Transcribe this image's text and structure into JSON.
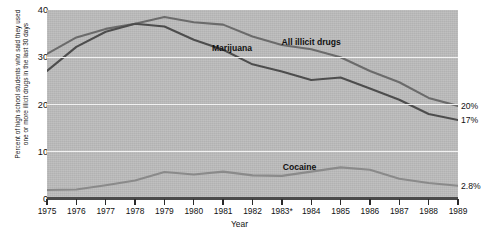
{
  "chart_data": {
    "type": "line",
    "title": "",
    "xlabel": "Year",
    "ylabel": "Percent of high school students who said they used\none or more illicit drugs in the last 30 days",
    "categories": [
      "1975",
      "1976",
      "1977",
      "1978",
      "1979",
      "1980",
      "1981",
      "1982",
      "1983*",
      "1984",
      "1985",
      "1986",
      "1987",
      "1988",
      "1989"
    ],
    "xtick_labels": [
      "1975",
      "1976",
      "1977",
      "1978",
      "1979",
      "1980",
      "1981",
      "1982",
      "1983*",
      "1984",
      "1985",
      "1986",
      "1987",
      "1988",
      "1989"
    ],
    "ytick_labels": [
      "40",
      "30",
      "20",
      "10",
      "0"
    ],
    "ylim": [
      0,
      40
    ],
    "yticks": [
      0,
      10,
      20,
      30,
      40
    ],
    "grid": "horizontal-white",
    "legend_position": "inline-labels",
    "series": [
      {
        "name": "All illicit drugs",
        "color": "#6b6b6b",
        "label_text": "All illicit drugs",
        "end_label": "20%",
        "values": [
          30.7,
          34.2,
          36.0,
          37.1,
          38.5,
          37.4,
          36.9,
          34.4,
          32.6,
          31.7,
          30.0,
          27.1,
          24.7,
          21.4,
          19.7
        ]
      },
      {
        "name": "Marijuana",
        "color": "#4d4d4d",
        "label_text": "Marijuana",
        "end_label": "17%",
        "values": [
          27.1,
          32.2,
          35.4,
          37.1,
          36.5,
          33.7,
          31.6,
          28.5,
          27.0,
          25.2,
          25.7,
          23.4,
          21.0,
          18.0,
          16.7
        ]
      },
      {
        "name": "Cocaine",
        "color": "#8a8a8a",
        "label_text": "Cocaine",
        "end_label": "2.8%",
        "values": [
          1.9,
          2.0,
          2.9,
          3.9,
          5.7,
          5.2,
          5.8,
          5.0,
          4.9,
          5.8,
          6.7,
          6.2,
          4.3,
          3.4,
          2.8
        ]
      }
    ],
    "annotations": [
      {
        "text": "20%",
        "series": "All illicit drugs",
        "position": "right-end"
      },
      {
        "text": "17%",
        "series": "Marijuana",
        "position": "right-end"
      },
      {
        "text": "2.8%",
        "series": "Cocaine",
        "position": "right-end"
      }
    ],
    "footnote_marker": "*",
    "colors": {
      "plot_background": "#bdbdbd",
      "gridline": "#f2f2f2",
      "axis": "#4a4a4a",
      "page_background": "#ffffff"
    }
  }
}
